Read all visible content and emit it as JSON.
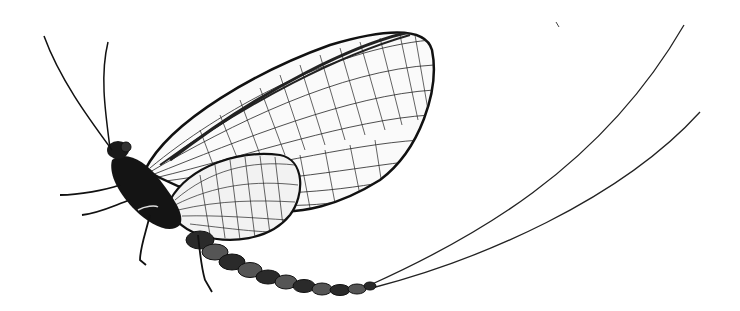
{
  "image": {
    "subject": "mayfly illustration",
    "style": "black and white engraving",
    "background": "#ffffff",
    "ink": "#111111"
  }
}
